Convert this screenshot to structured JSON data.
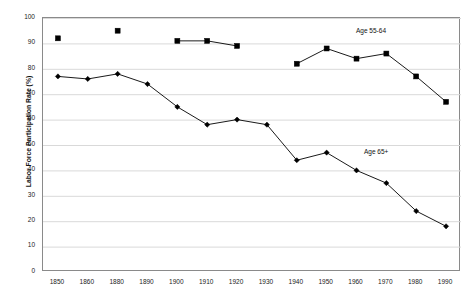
{
  "chart_data": {
    "type": "line",
    "title": "",
    "xlabel": "",
    "ylabel": "Labor Force Participation Rate (%)",
    "categories": [
      1850,
      1860,
      1880,
      1890,
      1900,
      1910,
      1920,
      1930,
      1940,
      1950,
      1960,
      1970,
      1980,
      1990
    ],
    "xtick_labels": [
      "1850",
      "1860",
      "1880",
      "1890",
      "1900",
      "1910",
      "1920",
      "1930",
      "1940",
      "1950",
      "1960",
      "1970",
      "1980",
      "1990"
    ],
    "ytick_labels": [
      "0",
      "10",
      "20",
      "30",
      "40",
      "50",
      "60",
      "70",
      "80",
      "90",
      "100"
    ],
    "yticks": [
      0,
      10,
      20,
      30,
      40,
      50,
      60,
      70,
      80,
      90,
      100
    ],
    "ylim": [
      0,
      100
    ],
    "grid": true,
    "legend_position": "inline-annotation",
    "series": [
      {
        "name": "Age 55-64",
        "annotation": "Age 55-64",
        "marker": "square",
        "color": "#000000",
        "values": [
          92,
          null,
          95,
          null,
          91,
          91,
          89,
          null,
          82,
          88,
          84,
          86,
          77,
          67
        ],
        "segments": [
          {
            "points": [
              [
                1850,
                92
              ]
            ]
          },
          {
            "points": [
              [
                1880,
                95
              ]
            ]
          },
          {
            "points": [
              [
                1900,
                91
              ],
              [
                1910,
                91
              ],
              [
                1920,
                89
              ]
            ]
          },
          {
            "points": [
              [
                1940,
                82
              ],
              [
                1950,
                88
              ],
              [
                1960,
                84
              ],
              [
                1970,
                86
              ],
              [
                1980,
                77
              ],
              [
                1990,
                67
              ]
            ]
          }
        ]
      },
      {
        "name": "Age 65+",
        "annotation": "Age 65+",
        "marker": "diamond",
        "color": "#000000",
        "values": [
          77,
          76,
          78,
          74,
          65,
          58,
          60,
          58,
          44,
          47,
          40,
          35,
          24,
          18
        ],
        "segments": [
          {
            "points": [
              [
                1850,
                77
              ],
              [
                1860,
                76
              ],
              [
                1880,
                78
              ],
              [
                1890,
                74
              ],
              [
                1900,
                65
              ],
              [
                1910,
                58
              ],
              [
                1920,
                60
              ],
              [
                1930,
                58
              ],
              [
                1940,
                44
              ],
              [
                1950,
                47
              ],
              [
                1960,
                40
              ],
              [
                1970,
                35
              ],
              [
                1980,
                24
              ],
              [
                1990,
                18
              ]
            ]
          }
        ]
      }
    ]
  },
  "colors": {
    "series": "#000000",
    "grid": "#d9d9d9",
    "frame": "#8a8a8a",
    "background": "#ffffff",
    "text": "#1a1a1a"
  }
}
